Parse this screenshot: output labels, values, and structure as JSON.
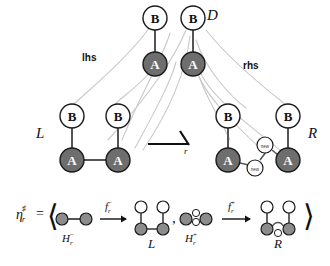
{
  "figure": {
    "colors": {
      "node_a_fill": "#6e6e6e",
      "node_b_fill": "#ffffff",
      "node_stroke": "#1a1a1a",
      "edge_dark": "#444444",
      "morphism_line": "#c9c9c9",
      "text": "#111111",
      "small_node_fill": "#ffffff"
    }
  },
  "top_graph": {
    "name_label": "D",
    "nodes": [
      {
        "id": "d-b-left",
        "label": "B",
        "type": "B"
      },
      {
        "id": "d-a-left",
        "label": "A",
        "type": "A"
      },
      {
        "id": "d-b-right",
        "label": "B",
        "type": "B"
      },
      {
        "id": "d-a-right",
        "label": "A",
        "type": "A"
      }
    ]
  },
  "morphisms": {
    "lhs_label": "lhs",
    "rhs_label": "rhs"
  },
  "rule_arrow": {
    "label": "r"
  },
  "left_graph": {
    "name_label": "L",
    "nodes": [
      {
        "id": "l-b-1",
        "label": "B",
        "type": "B"
      },
      {
        "id": "l-b-2",
        "label": "B",
        "type": "B"
      },
      {
        "id": "l-a-1",
        "label": "A",
        "type": "A"
      },
      {
        "id": "l-a-2",
        "label": "A",
        "type": "A"
      }
    ]
  },
  "right_graph": {
    "name_label": "R",
    "nodes": [
      {
        "id": "r-b-1",
        "label": "B",
        "type": "B"
      },
      {
        "id": "r-b-2",
        "label": "B",
        "type": "B"
      },
      {
        "id": "r-a-1",
        "label": "A",
        "type": "A"
      },
      {
        "id": "r-a-2",
        "label": "A",
        "type": "A"
      },
      {
        "id": "r-new-1",
        "label": "new",
        "type": "new"
      },
      {
        "id": "r-new-2",
        "label": "new",
        "type": "new"
      }
    ]
  },
  "formula": {
    "lhs_symbol": "η",
    "lhs_subscript": "r",
    "lhs_superscript": "♯",
    "equals": "=",
    "open_angle": "⟨",
    "close_angle": "⟩",
    "comma": ",",
    "terms": [
      {
        "id": "term-minus",
        "source_label": "H",
        "source_subscript": "r",
        "source_superscript": "−",
        "arrow_label": "f",
        "arrow_subscript": "r",
        "arrow_superscript": "−",
        "target_label": "L"
      },
      {
        "id": "term-plus",
        "source_label": "H",
        "source_subscript": "r",
        "source_superscript": "+",
        "arrow_label": "f",
        "arrow_subscript": "r",
        "arrow_superscript": "+",
        "target_label": "R"
      }
    ]
  }
}
